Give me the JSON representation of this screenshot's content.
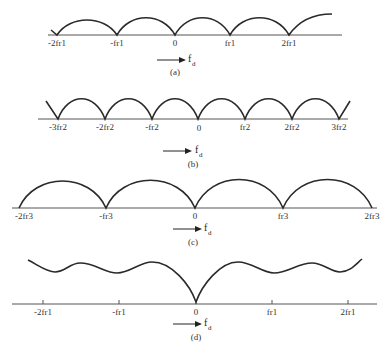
{
  "figure": {
    "panels": [
      {
        "id": "a",
        "caption": "(a)",
        "axis_variable": "f",
        "axis_variable_sub": "d",
        "tick_labels": [
          "-2fr1",
          "-fr1",
          "0",
          "fr1",
          "2fr1"
        ],
        "description": "Scalloped response with nulls at multiples of fr1"
      },
      {
        "id": "b",
        "caption": "(b)",
        "axis_variable": "f",
        "axis_variable_sub": "d",
        "tick_labels": [
          "-3fr2",
          "-2fr2",
          "-fr2",
          "0",
          "fr2",
          "2fr2",
          "3fr2"
        ],
        "description": "Scalloped response with nulls at multiples of fr2"
      },
      {
        "id": "c",
        "caption": "(c)",
        "axis_variable": "f",
        "axis_variable_sub": "d",
        "tick_labels": [
          "-2fr3",
          "-fr3",
          "0",
          "fr3",
          "2fr3"
        ],
        "description": "Scalloped response with nulls at multiples of fr3"
      },
      {
        "id": "d",
        "caption": "(d)",
        "axis_variable": "f",
        "axis_variable_sub": "d",
        "tick_labels": [
          "-2fr1",
          "-fr1",
          "0",
          "fr1",
          "2fr1"
        ],
        "description": "Combined staggered-PRF response: single null at 0, ripple elsewhere"
      }
    ]
  }
}
